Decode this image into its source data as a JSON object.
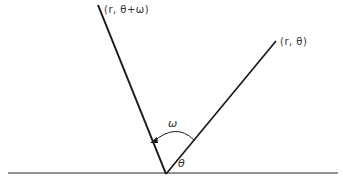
{
  "diagram": {
    "type": "polar rotation figure",
    "colors": {
      "line": "#1a1a1a",
      "text": "#333333",
      "background": "#ffffff"
    },
    "labels": {
      "rotated_point": "(r, θ+ω)",
      "original_point": "(r, θ)",
      "rotation_angle": "ω",
      "polar_angle": "θ"
    },
    "geometry": {
      "origin": [
        166,
        174
      ],
      "baseline": {
        "x1": 8,
        "x2": 338,
        "y": 173
      },
      "ray_rotated_end": [
        98,
        5
      ],
      "ray_original_end": [
        276,
        41
      ],
      "arc": {
        "from": [
          194,
          142
        ],
        "to": [
          151,
          142
        ],
        "arrow": "toward rotated ray"
      }
    }
  }
}
